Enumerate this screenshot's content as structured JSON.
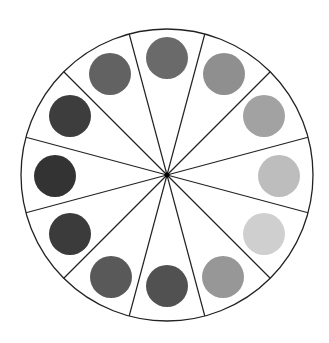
{
  "diagram": {
    "type": "value-wheel",
    "center": [
      167,
      175
    ],
    "radius": 146,
    "sector_count": 12,
    "divider_angles_deg": [
      15,
      45,
      75,
      105,
      135,
      165,
      195,
      225,
      255,
      285,
      315,
      345
    ],
    "line_color": "#222222",
    "dot_radius": 21,
    "dots": [
      {
        "position": "top",
        "cx": 167,
        "cy": 58,
        "color": "#6a6a6a"
      },
      {
        "position": "upper-right-1",
        "cx": 224,
        "cy": 74,
        "color": "#8f8f8f"
      },
      {
        "position": "upper-right-2",
        "cx": 264,
        "cy": 116,
        "color": "#a2a2a2"
      },
      {
        "position": "right",
        "cx": 279,
        "cy": 176,
        "color": "#bdbdbd"
      },
      {
        "position": "lower-right-2",
        "cx": 264,
        "cy": 234,
        "color": "#cfcfcf"
      },
      {
        "position": "lower-right-1",
        "cx": 223,
        "cy": 277,
        "color": "#979797"
      },
      {
        "position": "bottom",
        "cx": 167,
        "cy": 286,
        "color": "#515151"
      },
      {
        "position": "lower-left-1",
        "cx": 111,
        "cy": 277,
        "color": "#595959"
      },
      {
        "position": "lower-left-2",
        "cx": 70,
        "cy": 234,
        "color": "#3b3b3b"
      },
      {
        "position": "left",
        "cx": 55,
        "cy": 176,
        "color": "#333333"
      },
      {
        "position": "upper-left-2",
        "cx": 70,
        "cy": 116,
        "color": "#3d3d3d"
      },
      {
        "position": "upper-left-1",
        "cx": 110,
        "cy": 74,
        "color": "#626262"
      }
    ]
  }
}
